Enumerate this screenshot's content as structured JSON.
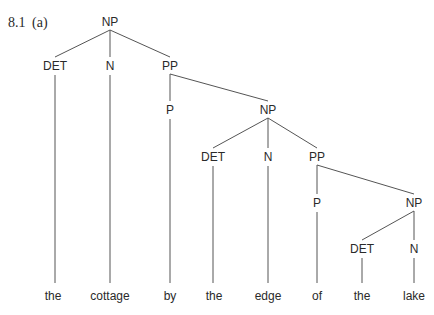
{
  "figure": {
    "number": "8.1",
    "part": "(a)"
  },
  "tree": {
    "nodes": [
      {
        "id": "np0",
        "label": "NP",
        "x": 110,
        "y": 22
      },
      {
        "id": "det1",
        "label": "DET",
        "x": 55,
        "y": 66
      },
      {
        "id": "n1",
        "label": "N",
        "x": 110,
        "y": 66
      },
      {
        "id": "pp1",
        "label": "PP",
        "x": 170,
        "y": 66
      },
      {
        "id": "p1",
        "label": "P",
        "x": 170,
        "y": 110
      },
      {
        "id": "np1",
        "label": "NP",
        "x": 268,
        "y": 110
      },
      {
        "id": "det2",
        "label": "DET",
        "x": 213,
        "y": 157
      },
      {
        "id": "n2",
        "label": "N",
        "x": 268,
        "y": 157
      },
      {
        "id": "pp2",
        "label": "PP",
        "x": 317,
        "y": 157
      },
      {
        "id": "p2",
        "label": "P",
        "x": 317,
        "y": 203
      },
      {
        "id": "np2",
        "label": "NP",
        "x": 414,
        "y": 203
      },
      {
        "id": "det3",
        "label": "DET",
        "x": 362,
        "y": 249
      },
      {
        "id": "n3",
        "label": "N",
        "x": 414,
        "y": 249
      }
    ],
    "edges": [
      [
        "np0",
        "det1"
      ],
      [
        "np0",
        "n1"
      ],
      [
        "np0",
        "pp1"
      ],
      [
        "pp1",
        "p1"
      ],
      [
        "pp1",
        "np1"
      ],
      [
        "np1",
        "det2"
      ],
      [
        "np1",
        "n2"
      ],
      [
        "np1",
        "pp2"
      ],
      [
        "pp2",
        "p2"
      ],
      [
        "pp2",
        "np2"
      ],
      [
        "np2",
        "det3"
      ],
      [
        "np2",
        "n3"
      ]
    ],
    "leaves": [
      {
        "word": "the",
        "x": 53,
        "parent": "det1"
      },
      {
        "word": "cottage",
        "x": 110,
        "parent": "n1"
      },
      {
        "word": "by",
        "x": 170,
        "parent": "p1"
      },
      {
        "word": "the",
        "x": 214,
        "parent": "det2"
      },
      {
        "word": "edge",
        "x": 268,
        "parent": "n2"
      },
      {
        "word": "of",
        "x": 317,
        "parent": "p2"
      },
      {
        "word": "the",
        "x": 362,
        "parent": "det3"
      },
      {
        "word": "lake",
        "x": 414,
        "parent": "n3"
      }
    ],
    "leaf_y": 300
  }
}
